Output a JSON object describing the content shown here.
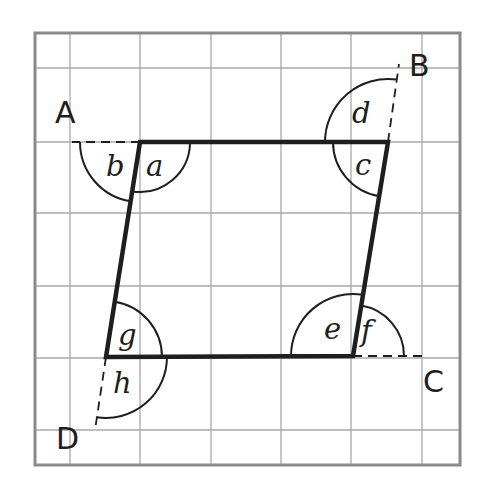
{
  "diagram": {
    "colors": {
      "ink": "#1e1e1e",
      "grid": "#a8a8a8",
      "border": "#8a8a8a",
      "background": "#ffffff"
    },
    "grid": {
      "border": {
        "x1": 35,
        "y1": 33,
        "x2": 460,
        "y2": 465
      },
      "vertical_lines_x": [
        70,
        140,
        211,
        281,
        351,
        422
      ],
      "horizontal_lines_y": [
        68,
        142,
        213,
        286,
        358,
        430
      ]
    },
    "vertices": {
      "top_left": {
        "x": 140,
        "y": 142
      },
      "top_right": {
        "x": 388,
        "y": 142
      },
      "bottom_right": {
        "x": 353,
        "y": 356
      },
      "bottom_left": {
        "x": 106,
        "y": 357
      }
    },
    "extensions": [
      {
        "name": "A",
        "from": {
          "x": 140,
          "y": 142
        },
        "to": {
          "x": 72,
          "y": 142
        }
      },
      {
        "name": "B",
        "from": {
          "x": 388,
          "y": 142
        },
        "to": {
          "x": 399,
          "y": 64
        }
      },
      {
        "name": "C",
        "from": {
          "x": 353,
          "y": 356
        },
        "to": {
          "x": 424,
          "y": 356
        }
      },
      {
        "name": "D",
        "from": {
          "x": 106,
          "y": 357
        },
        "to": {
          "x": 95,
          "y": 430
        }
      }
    ],
    "point_labels": [
      {
        "text": "A",
        "x": 55,
        "y": 123
      },
      {
        "text": "B",
        "x": 409,
        "y": 76
      },
      {
        "text": "C",
        "x": 423,
        "y": 392
      },
      {
        "text": "D",
        "x": 56,
        "y": 449
      }
    ],
    "angles": [
      {
        "label": "a",
        "cx": 140,
        "cy": 142,
        "r": 50,
        "start": 0,
        "end": 99,
        "tx": 146,
        "ty": 176
      },
      {
        "label": "b",
        "cx": 140,
        "cy": 142,
        "r": 60,
        "start": 99,
        "end": 180,
        "tx": 106,
        "ty": 176
      },
      {
        "label": "c",
        "cx": 388,
        "cy": 142,
        "r": 55,
        "start": 99,
        "end": 180,
        "tx": 355,
        "ty": 175
      },
      {
        "label": "d",
        "cx": 388,
        "cy": 142,
        "r": 63,
        "start": 180,
        "end": 278,
        "tx": 352,
        "ty": 123
      },
      {
        "label": "e",
        "cx": 353,
        "cy": 356,
        "r": 62,
        "start": 180,
        "end": 279,
        "tx": 324,
        "ty": 339
      },
      {
        "label": "f",
        "cx": 353,
        "cy": 356,
        "r": 51,
        "start": 279,
        "end": 360,
        "tx": 361,
        "ty": 341
      },
      {
        "label": "g",
        "cx": 106,
        "cy": 357,
        "r": 56,
        "start": 279,
        "end": 360,
        "tx": 118,
        "ty": 345
      },
      {
        "label": "h",
        "cx": 106,
        "cy": 357,
        "r": 61,
        "start": 0,
        "end": 99,
        "tx": 113,
        "ty": 393
      }
    ]
  }
}
